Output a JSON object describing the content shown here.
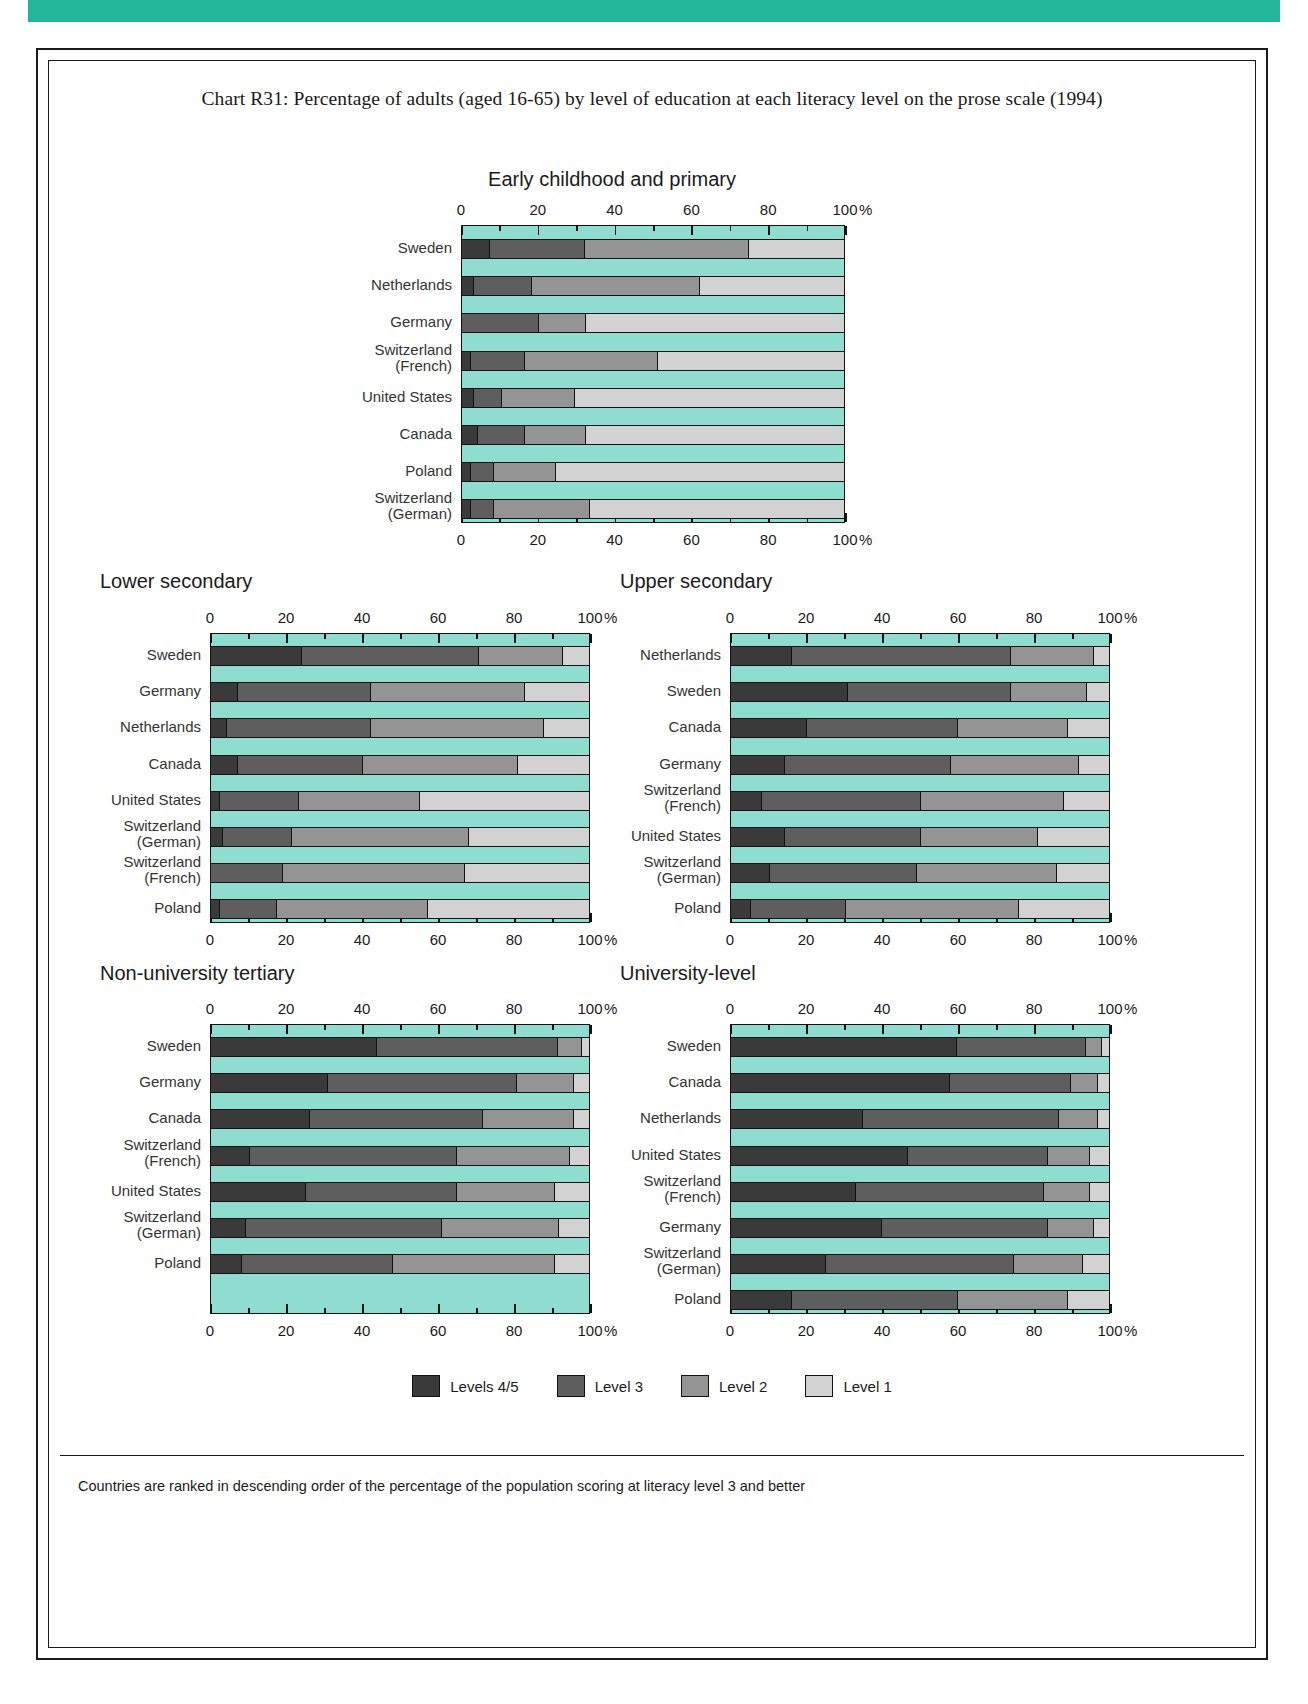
{
  "page": {
    "title": "Chart R31: Percentage of adults (aged 16-65) by level of education at each literacy level on the prose scale (1994)",
    "footnote": "Countries are ranked in descending order of the percentage of the population scoring at literacy level 3 and better",
    "percent_symbol": "%",
    "colors": {
      "banner": "#22b79b",
      "plot_background": "#8fdcd0",
      "level45": "#3a3a3a",
      "level3": "#5e5e5e",
      "level2": "#949494",
      "level1": "#d2d2d2"
    }
  },
  "legend": {
    "items": [
      {
        "label": "Levels 4/5",
        "key": "l45"
      },
      {
        "label": "Level 3",
        "key": "l3"
      },
      {
        "label": "Level 2",
        "key": "l2"
      },
      {
        "label": "Level 1",
        "key": "l1"
      }
    ]
  },
  "axis": {
    "ticks": [
      0,
      20,
      40,
      60,
      80,
      100
    ],
    "minor_step": 10,
    "range": [
      0,
      100
    ],
    "unit": "%"
  },
  "chart_data": {
    "type": "bar",
    "orientation": "horizontal",
    "stacked": true,
    "title": "Chart R31: Percentage of adults (aged 16-65) by level of education at each literacy level on the prose scale (1994)",
    "xlabel": "%",
    "ylabel": "",
    "xlim": [
      0,
      100
    ],
    "grid": false,
    "legend_position": "bottom",
    "series_names": [
      "Levels 4/5",
      "Level 3",
      "Level 2",
      "Level 1"
    ],
    "panels": [
      {
        "title": "Early childhood and primary",
        "categories": [
          "Sweden",
          "Netherlands",
          "Germany",
          "Switzerland\n(French)",
          "United States",
          "Canada",
          "Poland",
          "Switzerland\n(German)"
        ],
        "rows": [
          {
            "name": "Sweden",
            "values": [
              7,
              25,
              43,
              25
            ]
          },
          {
            "name": "Netherlands",
            "values": [
              3,
              15,
              44,
              38
            ]
          },
          {
            "name": "Germany",
            "values": [
              0,
              20,
              12,
              68
            ]
          },
          {
            "name": "Switzerland (French)",
            "values": [
              2,
              14,
              35,
              49
            ]
          },
          {
            "name": "United States",
            "values": [
              3,
              7,
              19,
              71
            ]
          },
          {
            "name": "Canada",
            "values": [
              4,
              12,
              16,
              68
            ]
          },
          {
            "name": "Poland",
            "values": [
              2,
              6,
              16,
              76
            ]
          },
          {
            "name": "Switzerland (German)",
            "values": [
              2,
              6,
              25,
              67
            ]
          }
        ]
      },
      {
        "title": "Lower secondary",
        "categories": [
          "Sweden",
          "Germany",
          "Netherlands",
          "Canada",
          "United States",
          "Switzerland\n(German)",
          "Switzerland\n(French)",
          "Poland"
        ],
        "rows": [
          {
            "name": "Sweden",
            "values": [
              24,
              47,
              22,
              7
            ]
          },
          {
            "name": "Germany",
            "values": [
              7,
              35,
              41,
              17
            ]
          },
          {
            "name": "Netherlands",
            "values": [
              4,
              38,
              46,
              12
            ]
          },
          {
            "name": "Canada",
            "values": [
              7,
              33,
              41,
              19
            ]
          },
          {
            "name": "United States",
            "values": [
              2,
              21,
              32,
              45
            ]
          },
          {
            "name": "Switzerland (German)",
            "values": [
              3,
              18,
              47,
              32
            ]
          },
          {
            "name": "Switzerland (French)",
            "values": [
              0,
              19,
              48,
              33
            ]
          },
          {
            "name": "Poland",
            "values": [
              2,
              15,
              40,
              43
            ]
          }
        ]
      },
      {
        "title": "Upper secondary",
        "categories": [
          "Netherlands",
          "Sweden",
          "Canada",
          "Germany",
          "Switzerland\n(French)",
          "United States",
          "Switzerland\n(German)",
          "Poland"
        ],
        "rows": [
          {
            "name": "Netherlands",
            "values": [
              16,
              58,
              22,
              4
            ]
          },
          {
            "name": "Sweden",
            "values": [
              31,
              43,
              20,
              6
            ]
          },
          {
            "name": "Canada",
            "values": [
              20,
              40,
              29,
              11
            ]
          },
          {
            "name": "Germany",
            "values": [
              14,
              44,
              34,
              8
            ]
          },
          {
            "name": "Switzerland (French)",
            "values": [
              8,
              42,
              38,
              12
            ]
          },
          {
            "name": "United States",
            "values": [
              14,
              36,
              31,
              19
            ]
          },
          {
            "name": "Switzerland (German)",
            "values": [
              10,
              39,
              37,
              14
            ]
          },
          {
            "name": "Poland",
            "values": [
              5,
              25,
              46,
              24
            ]
          }
        ]
      },
      {
        "title": "Non-university tertiary",
        "categories": [
          "Sweden",
          "Germany",
          "Canada",
          "Switzerland\n(French)",
          "United States",
          "Switzerland\n(German)",
          "Poland"
        ],
        "rows": [
          {
            "name": "Sweden",
            "values": [
              44,
              48,
              6,
              2
            ]
          },
          {
            "name": "Germany",
            "values": [
              31,
              50,
              15,
              4
            ]
          },
          {
            "name": "Canada",
            "values": [
              26,
              46,
              24,
              4
            ]
          },
          {
            "name": "Switzerland (French)",
            "values": [
              10,
              55,
              30,
              5
            ]
          },
          {
            "name": "United States",
            "values": [
              25,
              40,
              26,
              9
            ]
          },
          {
            "name": "Switzerland (German)",
            "values": [
              9,
              52,
              31,
              8
            ]
          },
          {
            "name": "Poland",
            "values": [
              8,
              40,
              43,
              9
            ]
          }
        ]
      },
      {
        "title": "University-level",
        "categories": [
          "Sweden",
          "Canada",
          "Netherlands",
          "United States",
          "Switzerland\n(French)",
          "Germany",
          "Switzerland\n(German)",
          "Poland"
        ],
        "rows": [
          {
            "name": "Sweden",
            "values": [
              60,
              34,
              4,
              2
            ]
          },
          {
            "name": "Canada",
            "values": [
              58,
              32,
              7,
              3
            ]
          },
          {
            "name": "Netherlands",
            "values": [
              35,
              52,
              10,
              3
            ]
          },
          {
            "name": "United States",
            "values": [
              47,
              37,
              11,
              5
            ]
          },
          {
            "name": "Switzerland (French)",
            "values": [
              33,
              50,
              12,
              5
            ]
          },
          {
            "name": "Germany",
            "values": [
              40,
              44,
              12,
              4
            ]
          },
          {
            "name": "Switzerland (German)",
            "values": [
              25,
              50,
              18,
              7
            ]
          },
          {
            "name": "Poland",
            "values": [
              16,
              44,
              29,
              11
            ]
          }
        ]
      }
    ]
  }
}
